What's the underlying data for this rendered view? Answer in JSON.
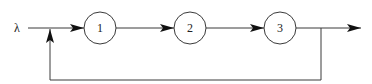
{
  "diagram": {
    "type": "queueing-network-feedback",
    "input_label": "λ",
    "nodes": [
      {
        "id": "1",
        "label": "1",
        "cx": 100,
        "cy": 28,
        "r": 16
      },
      {
        "id": "2",
        "label": "2",
        "cx": 190,
        "cy": 28,
        "r": 16
      },
      {
        "id": "3",
        "label": "3",
        "cx": 280,
        "cy": 28,
        "r": 16
      }
    ],
    "edges": [
      {
        "from": "input",
        "to": "1"
      },
      {
        "from": "1",
        "to": "2"
      },
      {
        "from": "2",
        "to": "3"
      },
      {
        "from": "3",
        "to": "output"
      },
      {
        "from": "3",
        "to": "1",
        "kind": "feedback"
      }
    ],
    "colors": {
      "stroke": "#3a3a3a",
      "background": "#ffffff"
    }
  }
}
